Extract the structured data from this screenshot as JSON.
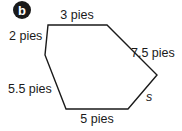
{
  "figure": {
    "badge": "b",
    "shape": "hexagon",
    "stroke_color": "#1a1a1a",
    "sides": [
      {
        "id": "top",
        "label": "3 pies"
      },
      {
        "id": "upper-right",
        "label": "7.5 pies"
      },
      {
        "id": "lower-right",
        "label": "s"
      },
      {
        "id": "bottom",
        "label": "5 pies"
      },
      {
        "id": "lower-left",
        "label": "5.5 pies"
      },
      {
        "id": "upper-left",
        "label": "2 pies"
      }
    ]
  }
}
